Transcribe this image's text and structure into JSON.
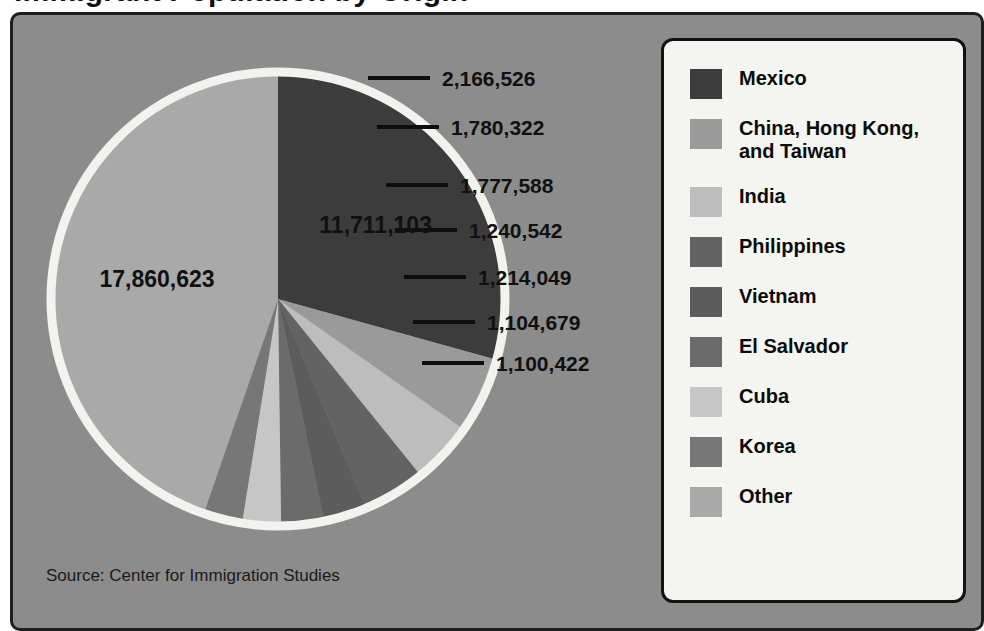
{
  "title_cropped": "Immigrant Population by Origin",
  "source": "Source: Center for Immigration Studies",
  "legend": {
    "items": [
      {
        "label": "Mexico",
        "color": "#3c3c3c"
      },
      {
        "label": "China, Hong Kong, and Taiwan",
        "color": "#9a9a9a"
      },
      {
        "label": "India",
        "color": "#bdbdbd"
      },
      {
        "label": "Philippines",
        "color": "#636363"
      },
      {
        "label": "Vietnam",
        "color": "#5c5c5c"
      },
      {
        "label": "El Salvador",
        "color": "#6b6b6b"
      },
      {
        "label": "Cuba",
        "color": "#c6c6c6"
      },
      {
        "label": "Korea",
        "color": "#777777"
      },
      {
        "label": "Other",
        "color": "#a9a9a9"
      }
    ]
  },
  "chart_data": {
    "type": "pie",
    "title": "Immigrant Population by Origin",
    "source": "Source: Center for Immigration Studies",
    "legend_position": "right",
    "value_format": "comma-separated integers",
    "categories": [
      "Mexico",
      "China, Hong Kong, and Taiwan",
      "India",
      "Philippines",
      "Vietnam",
      "El Salvador",
      "Cuba",
      "Korea",
      "Other"
    ],
    "values": [
      11711103,
      2166526,
      1780322,
      1777588,
      1240542,
      1214049,
      1104679,
      1100422,
      17860623
    ],
    "labels": [
      "11,711,103",
      "2,166,526",
      "1,780,322",
      "1,777,588",
      "1,240,542",
      "1,214,049",
      "1,104,679",
      "1,100,422",
      "17,860,623"
    ],
    "colors": [
      "#3c3c3c",
      "#9a9a9a",
      "#bdbdbd",
      "#636363",
      "#5c5c5c",
      "#6b6b6b",
      "#c6c6c6",
      "#777777",
      "#a9a9a9"
    ],
    "label_placement": [
      "inside",
      "callout",
      "callout",
      "callout",
      "callout",
      "callout",
      "callout",
      "callout",
      "inside"
    ],
    "total": 39955854,
    "start_angle_deg": 270,
    "direction": "clockwise"
  }
}
